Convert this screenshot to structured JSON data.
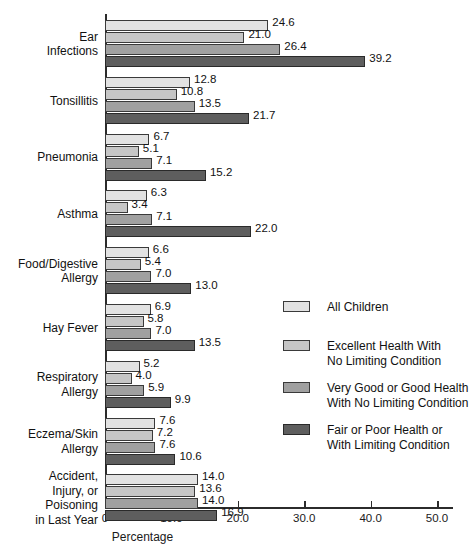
{
  "chart_data": {
    "type": "bar",
    "orientation": "horizontal",
    "title": "",
    "xlabel": "Percentage",
    "ylabel": "",
    "xlim": [
      0,
      52.4
    ],
    "xticks": [
      0,
      10,
      20,
      30,
      40,
      50
    ],
    "xtick_labels": [
      "0",
      "10.0",
      "20.0",
      "30.0",
      "40.0",
      "50.0"
    ],
    "grid": false,
    "legend_position": "right",
    "categories": [
      "Ear\nInfections",
      "Tonsillitis",
      "Pneumonia",
      "Asthma",
      "Food/Digestive\nAllergy",
      "Hay Fever",
      "Respiratory\nAllergy",
      "Eczema/Skin\nAllergy",
      "Accident,\nInjury, or\nPoisoning\nin Last Year"
    ],
    "series": [
      {
        "name": "All Children",
        "color": "#e2e2e2",
        "values": [
          24.6,
          12.8,
          6.7,
          6.3,
          6.6,
          6.9,
          5.2,
          7.6,
          14.0
        ],
        "labels": [
          "24.6",
          "12.8",
          "6.7",
          "6.3",
          "6.6",
          "6.9",
          "5.2",
          "7.6",
          "14.0"
        ]
      },
      {
        "name": "Excellent Health With\nNo Limiting Condition",
        "color": "#c6c6c6",
        "values": [
          21.0,
          10.8,
          5.1,
          3.4,
          5.4,
          5.8,
          4.0,
          7.2,
          13.6
        ],
        "labels": [
          "21.0",
          "10.8",
          "5.1",
          "3.4",
          "5.4",
          "5.8",
          "4.0",
          "7.2",
          "13.6"
        ]
      },
      {
        "name": "Very Good or Good Health\nWith No Limiting Condition",
        "color": "#a0a0a0",
        "values": [
          26.4,
          13.5,
          7.1,
          7.1,
          7.0,
          7.0,
          5.9,
          7.6,
          14.0
        ],
        "labels": [
          "26.4",
          "13.5",
          "7.1",
          "7.1",
          "7.0",
          "7.0",
          "5.9",
          "7.6",
          "14.0"
        ]
      },
      {
        "name": "Fair or Poor Health or\nWith Limiting Condition",
        "color": "#5e5e5e",
        "values": [
          39.2,
          21.7,
          15.2,
          22.0,
          13.0,
          13.5,
          9.9,
          10.6,
          16.9
        ],
        "labels": [
          "39.2",
          "21.7",
          "15.2",
          "22.0",
          "13.0",
          "13.5",
          "9.9",
          "10.6",
          "16.9"
        ]
      }
    ]
  },
  "legend": {
    "entries": [
      {
        "label": "All Children",
        "swatch": "s0"
      },
      {
        "label": "Excellent Health With\nNo Limiting Condition",
        "swatch": "s1"
      },
      {
        "label": "Very Good or Good Health\nWith No Limiting Condition",
        "swatch": "s2"
      },
      {
        "label": "Fair or Poor Health or\nWith Limiting Condition",
        "swatch": "s3"
      }
    ]
  }
}
